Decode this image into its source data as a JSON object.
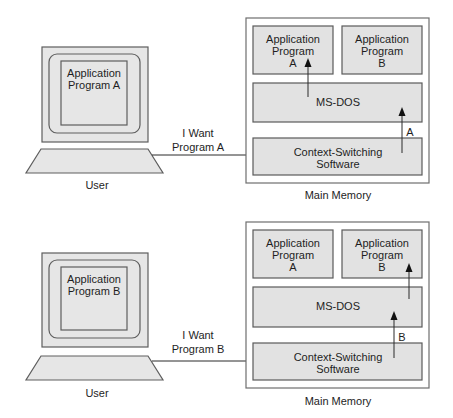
{
  "panels": [
    {
      "user": {
        "screen_line1": "Application",
        "screen_line2": "Program A",
        "label": "User"
      },
      "request": {
        "line1": "I Want",
        "line2": "Program A"
      },
      "memory": {
        "label": "Main Memory",
        "app_a": {
          "line1": "Application",
          "line2": "Program",
          "line3": "A"
        },
        "app_b": {
          "line1": "Application",
          "line2": "Program",
          "line3": "B"
        },
        "msdos": "MS-DOS",
        "context": {
          "line1": "Context-Switching",
          "line2": "Software"
        },
        "arrow_label": "A"
      }
    },
    {
      "user": {
        "screen_line1": "Application",
        "screen_line2": "Program B",
        "label": "User"
      },
      "request": {
        "line1": "I Want",
        "line2": "Program B"
      },
      "memory": {
        "label": "Main Memory",
        "app_a": {
          "line1": "Application",
          "line2": "Program",
          "line3": "A"
        },
        "app_b": {
          "line1": "Application",
          "line2": "Program",
          "line3": "B"
        },
        "msdos": "MS-DOS",
        "context": {
          "line1": "Context-Switching",
          "line2": "Software"
        },
        "arrow_label": "B"
      }
    }
  ],
  "colors": {
    "box_fill": "#e2e2e2",
    "border": "#5a5a5a",
    "text": "#1e1e1e"
  }
}
